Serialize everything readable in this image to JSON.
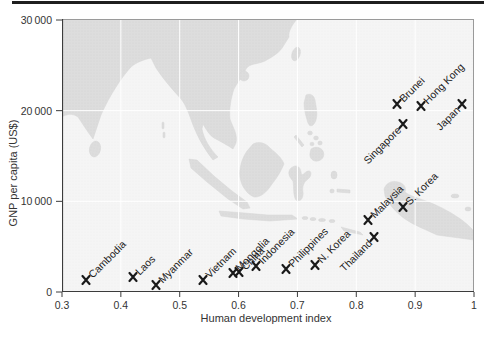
{
  "figure": {
    "top_rule": "horizontal black rule above figure"
  },
  "chart_data": {
    "type": "scatter",
    "title": "",
    "xlabel": "Human development index",
    "ylabel": "GNP per capita (US$)",
    "xlim": [
      0.3,
      1.0
    ],
    "ylim": [
      0,
      30000
    ],
    "x_ticks": [
      0.3,
      0.4,
      0.5,
      0.6,
      0.7,
      0.8,
      0.9,
      1
    ],
    "x_tick_labels": [
      "0.3",
      "0.4",
      "0.5",
      "0.6",
      "0.7",
      "0.8",
      "0.9",
      "1"
    ],
    "y_ticks": [
      0,
      10000,
      20000,
      30000
    ],
    "y_tick_labels": [
      "0",
      "10 000",
      "20 000",
      "30 000"
    ],
    "legend": "none",
    "marker_symbol": "x",
    "grid": "white gridlines at each tick, visible over the land of the basemap",
    "basemap": "Asia (India, China, Indochina, Indonesia, Philippines, New Guinea)",
    "points": [
      {
        "label": "Cambodia",
        "x": 0.34,
        "y": 1300,
        "label_side": "above-right"
      },
      {
        "label": "Laos",
        "x": 0.42,
        "y": 1600,
        "label_side": "above-right"
      },
      {
        "label": "Myanmar",
        "x": 0.46,
        "y": 800,
        "label_side": "above-right"
      },
      {
        "label": "Vietnam",
        "x": 0.54,
        "y": 1300,
        "label_side": "above-right"
      },
      {
        "label": "Mongolia",
        "x": 0.59,
        "y": 2100,
        "label_side": "above-right"
      },
      {
        "label": "China",
        "x": 0.6,
        "y": 2200,
        "label_side": "above-right"
      },
      {
        "label": "Indonesia",
        "x": 0.63,
        "y": 2900,
        "label_side": "above-right"
      },
      {
        "label": "Philippines",
        "x": 0.68,
        "y": 2500,
        "label_side": "above-right"
      },
      {
        "label": "N. Korea",
        "x": 0.73,
        "y": 3000,
        "label_side": "above-right"
      },
      {
        "label": "Thailand",
        "x": 0.83,
        "y": 6100,
        "label_side": "below-left"
      },
      {
        "label": "Malaysia",
        "x": 0.82,
        "y": 7900,
        "label_side": "above-right"
      },
      {
        "label": "S. Korea",
        "x": 0.88,
        "y": 9400,
        "label_side": "above-right"
      },
      {
        "label": "Singapore",
        "x": 0.88,
        "y": 18500,
        "label_side": "below-left"
      },
      {
        "label": "Brunei",
        "x": 0.87,
        "y": 20700,
        "label_side": "above-right"
      },
      {
        "label": "Hong Kong",
        "x": 0.91,
        "y": 20500,
        "label_side": "above-right"
      },
      {
        "label": "Japan",
        "x": 0.98,
        "y": 20700,
        "label_side": "below-left"
      }
    ],
    "colors": {
      "marker": "#1a1a1a",
      "land": "#dcdcdc",
      "sea": "#f5f5f5",
      "gridline": "#ffffff",
      "frame": "#9a9a9a",
      "axis": "#3c3c3c",
      "text": "#2b2b2b",
      "top_rule": "#1f1f1f"
    }
  }
}
